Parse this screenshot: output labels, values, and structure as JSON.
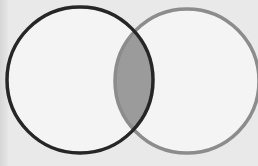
{
  "diagram": {
    "type": "venn",
    "sets": [
      {
        "id": "A",
        "label": "",
        "cx": 80,
        "cy": 80,
        "r": 73,
        "stroke": "#262626",
        "fill": "#f4f4f4"
      },
      {
        "id": "B",
        "label": "",
        "cx": 187,
        "cy": 81,
        "r": 72,
        "stroke": "#8c8c8c",
        "fill": "#f4f4f4"
      }
    ],
    "intersection": {
      "sets": [
        "A",
        "B"
      ],
      "fill": "#9b9b9b",
      "shaded": true
    },
    "background": "#e9e9e9"
  }
}
